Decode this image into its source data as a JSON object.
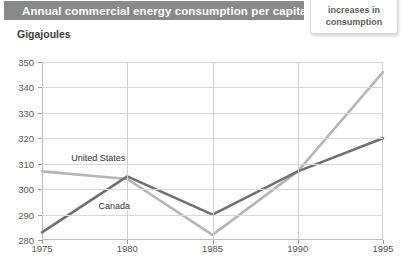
{
  "header": {
    "title": "Annual commercial energy consumption per capita"
  },
  "callout": {
    "lines": [
      "increases in",
      "consumption"
    ]
  },
  "colors": {
    "title_bar": "#898989",
    "title_text": "#ffffff",
    "united_states_line": "#b5b5b5",
    "canada_line": "#707070",
    "grid": "#d9d9d9",
    "axis": "#bdbdbd",
    "tick_text": "#585858"
  },
  "chart_data": {
    "type": "line",
    "title": "Annual commercial energy consumption per capita",
    "xlabel": "",
    "ylabel": "Gigajoules",
    "x": [
      1975,
      1980,
      1985,
      1990,
      1995
    ],
    "xtick_labels": [
      "1975",
      "1980",
      "1985",
      "1990",
      "1995"
    ],
    "ytick_labels": [
      "280",
      "290",
      "300",
      "310",
      "320",
      "330",
      "340",
      "350"
    ],
    "yticks": [
      280,
      290,
      300,
      310,
      320,
      330,
      340,
      350
    ],
    "ylim": [
      280,
      350
    ],
    "xlim": [
      1975,
      1995
    ],
    "grid": true,
    "legend": "inline-labels",
    "series": [
      {
        "name": "United States",
        "color": "#b5b5b5",
        "values": [
          307,
          304,
          282,
          307,
          346
        ],
        "label_x": 1976.6,
        "label_y": 312
      },
      {
        "name": "Canada",
        "color": "#707070",
        "values": [
          283,
          305,
          290,
          307,
          320
        ],
        "label_x": 1978.2,
        "label_y": 293
      }
    ]
  }
}
